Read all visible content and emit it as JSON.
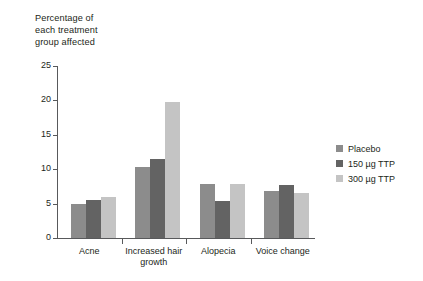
{
  "chart_data": {
    "type": "bar",
    "title": "",
    "ylabel": "Percentage of\neach treatment\ngroup affected",
    "xlabel": "",
    "ylim": [
      0,
      25
    ],
    "yticks": [
      0,
      5,
      10,
      15,
      20,
      25
    ],
    "ytick_labels": [
      "0",
      "5",
      "10",
      "15",
      "20",
      "25"
    ],
    "grid": false,
    "legend_position": "right",
    "categories": [
      "Acne",
      "Increased hair growth",
      "Alopecia",
      "Voice change"
    ],
    "category_lines": [
      [
        "Acne"
      ],
      [
        "Increased hair",
        "growth"
      ],
      [
        "Alopecia"
      ],
      [
        "Voice change"
      ]
    ],
    "series": [
      {
        "name": "Placebo",
        "color": "#8c8c8c",
        "values": [
          5.0,
          10.3,
          7.8,
          6.9
        ]
      },
      {
        "name": "150 µg TTP",
        "color": "#636363",
        "values": [
          5.5,
          11.5,
          5.4,
          7.7
        ]
      },
      {
        "name": "300 µg TTP",
        "color": "#c4c4c4",
        "values": [
          5.9,
          19.8,
          7.8,
          6.6
        ]
      }
    ]
  },
  "axis": {
    "caption": "Percentage of\neach treatment\ngroup affected"
  },
  "legend": {
    "items": [
      {
        "label": "Placebo",
        "color": "#8c8c8c"
      },
      {
        "label": "150 µg TTP",
        "color": "#636363"
      },
      {
        "label": "300 µg TTP",
        "color": "#c4c4c4"
      }
    ]
  },
  "colors": {
    "axis": "#58595b",
    "text": "#231f20",
    "background": "#ffffff",
    "series_placebo": "#8c8c8c",
    "series_150": "#636363",
    "series_300": "#c4c4c4"
  }
}
